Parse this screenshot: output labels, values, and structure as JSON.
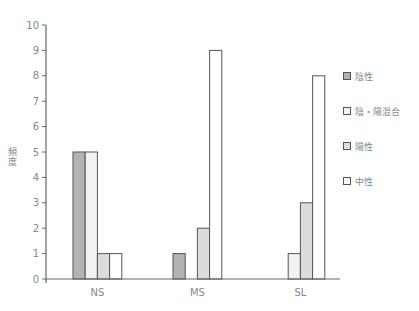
{
  "chart_data": {
    "type": "bar",
    "title": "",
    "xlabel": "",
    "ylabel": "頻度",
    "ylim": [
      0,
      10
    ],
    "yticks": [
      0,
      1,
      2,
      3,
      4,
      5,
      6,
      7,
      8,
      9,
      10
    ],
    "categories": [
      "NS",
      "MS",
      "SL"
    ],
    "series": [
      {
        "name": "陰性",
        "color": "#b3b3b3",
        "values": [
          5,
          1,
          0
        ]
      },
      {
        "name": "陰・陽混合",
        "color": "#f2f2f2",
        "values": [
          5,
          0,
          1
        ]
      },
      {
        "name": "陽性",
        "color": "#dcdcdc",
        "values": [
          1,
          2,
          3
        ]
      },
      {
        "name": "中性",
        "color": "#ffffff",
        "values": [
          1,
          9,
          8
        ]
      }
    ],
    "grid": false,
    "legend_position": "right"
  },
  "legend": {
    "items": [
      {
        "label": "陰性",
        "color": "#b3b3b3"
      },
      {
        "label": "陰・陽混合",
        "color": "#f2f2f2"
      },
      {
        "label": "陽性",
        "color": "#dcdcdc"
      },
      {
        "label": "中性",
        "color": "#ffffff"
      }
    ]
  },
  "axis": {
    "ylabel": "頻度"
  }
}
